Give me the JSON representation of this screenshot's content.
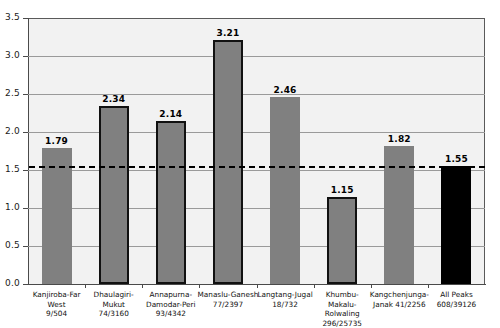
{
  "chart_data": {
    "type": "bar",
    "title": "",
    "xlabel": "",
    "ylabel": "",
    "ylim": [
      0.0,
      3.5
    ],
    "ytick_values": [
      "3.5",
      "3.0",
      "2.5",
      "2.0",
      "1.5",
      "1.0",
      "0.5",
      "0.0"
    ],
    "grid": true,
    "legend": "none",
    "categories": [
      "Kanjiroba-Far West",
      "Dhaulagiri-Mukut",
      "Annapurna-Damodar-Peri",
      "Manaslu-Ganesh",
      "Langtang-Jugal",
      "Khumbu-Makalu-Rolwaling",
      "Kangchenjunga-Janak",
      "All Peaks"
    ],
    "values": [
      1.79,
      2.34,
      2.14,
      3.21,
      2.46,
      1.15,
      1.82,
      1.55
    ],
    "value_labels": [
      "1.79",
      "2.34",
      "2.14",
      "3.21",
      "2.46",
      "1.15",
      "1.82",
      "1.55"
    ],
    "reference_line": {
      "value": 1.55,
      "style": "dashed",
      "color": "#000000"
    },
    "bars": [
      {
        "label_line1": "Kanjiroba-Far West",
        "label_line2": "9/504",
        "label_line3": "",
        "value": 1.79,
        "value_text": "1.79",
        "fill": "#808080",
        "outlined": false
      },
      {
        "label_line1": "Dhaulagiri-Mukut",
        "label_line2": "74/3160",
        "label_line3": "",
        "value": 2.34,
        "value_text": "2.34",
        "fill": "#808080",
        "outlined": true
      },
      {
        "label_line1": "Annapurna-",
        "label_line2": "Damodar-Peri",
        "label_line3": "93/4342",
        "value": 2.14,
        "value_text": "2.14",
        "fill": "#808080",
        "outlined": true
      },
      {
        "label_line1": "Manaslu-Ganesh",
        "label_line2": "77/2397",
        "label_line3": "",
        "value": 3.21,
        "value_text": "3.21",
        "fill": "#808080",
        "outlined": true
      },
      {
        "label_line1": "Langtang-Jugal",
        "label_line2": "18/732",
        "label_line3": "",
        "value": 2.46,
        "value_text": "2.46",
        "fill": "#808080",
        "outlined": false
      },
      {
        "label_line1": "Khumbu-Makalu-",
        "label_line2": "Rolwaling",
        "label_line3": "296/25735",
        "value": 1.15,
        "value_text": "1.15",
        "fill": "#808080",
        "outlined": true
      },
      {
        "label_line1": "Kangchenjunga-",
        "label_line2": "Janak 41/2256",
        "label_line3": "",
        "value": 1.82,
        "value_text": "1.82",
        "fill": "#808080",
        "outlined": false
      },
      {
        "label_line1": "All Peaks",
        "label_line2": "608/39126",
        "label_line3": "",
        "value": 1.55,
        "value_text": "1.55",
        "fill": "#000000",
        "outlined": false
      }
    ]
  },
  "colors": {
    "bar_gray": "#808080",
    "bar_black": "#000000",
    "plot_background": "#f2f2f2",
    "gridline": "#9a9a9a",
    "axis": "#4a4a4a",
    "reference_line": "#000000"
  }
}
